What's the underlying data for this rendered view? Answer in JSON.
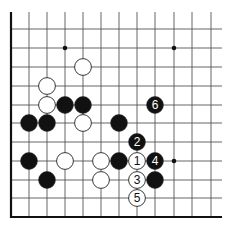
{
  "diagram": {
    "type": "go-board-fragment",
    "colors": {
      "background": "#ffffff",
      "line": "#555555",
      "edge": "#111111",
      "black_stone": "#111111",
      "white_stone": "#ffffff",
      "stone_outline": "#222222"
    },
    "grid": {
      "x": [
        11,
        29,
        47,
        65,
        83,
        101,
        119,
        137,
        155,
        174,
        192,
        211
      ],
      "y": [
        29,
        48,
        67,
        86,
        105,
        123,
        142,
        161,
        180,
        198,
        217
      ],
      "line_start_y": 12,
      "line_end_x": 222,
      "left_edge_x": 11,
      "bottom_edge_y": 217
    },
    "star_points": [
      {
        "col": 3,
        "row": 1
      },
      {
        "col": 9,
        "row": 1
      },
      {
        "col": 9,
        "row": 7
      }
    ],
    "stones": [
      {
        "color": "white",
        "col": 4,
        "row": 2,
        "label": ""
      },
      {
        "color": "white",
        "col": 2,
        "row": 3,
        "label": ""
      },
      {
        "color": "white",
        "col": 2,
        "row": 4,
        "label": ""
      },
      {
        "color": "black",
        "col": 3,
        "row": 4,
        "label": ""
      },
      {
        "color": "black",
        "col": 4,
        "row": 4,
        "label": ""
      },
      {
        "color": "black",
        "col": 8,
        "row": 4,
        "label": "6"
      },
      {
        "color": "black",
        "col": 1,
        "row": 5,
        "label": ""
      },
      {
        "color": "black",
        "col": 2,
        "row": 5,
        "label": ""
      },
      {
        "color": "white",
        "col": 4,
        "row": 5,
        "label": ""
      },
      {
        "color": "black",
        "col": 6,
        "row": 5,
        "label": ""
      },
      {
        "color": "black",
        "col": 7,
        "row": 6,
        "label": "2"
      },
      {
        "color": "black",
        "col": 1,
        "row": 7,
        "label": ""
      },
      {
        "color": "white",
        "col": 3,
        "row": 7,
        "label": ""
      },
      {
        "color": "white",
        "col": 5,
        "row": 7,
        "label": ""
      },
      {
        "color": "black",
        "col": 6,
        "row": 7,
        "label": ""
      },
      {
        "color": "white",
        "col": 7,
        "row": 7,
        "label": "1"
      },
      {
        "color": "black",
        "col": 8,
        "row": 7,
        "label": "4"
      },
      {
        "color": "black",
        "col": 2,
        "row": 8,
        "label": ""
      },
      {
        "color": "white",
        "col": 5,
        "row": 8,
        "label": ""
      },
      {
        "color": "white",
        "col": 7,
        "row": 8,
        "label": "3"
      },
      {
        "color": "black",
        "col": 8,
        "row": 8,
        "label": ""
      },
      {
        "color": "white",
        "col": 7,
        "row": 9,
        "label": "5"
      }
    ]
  }
}
